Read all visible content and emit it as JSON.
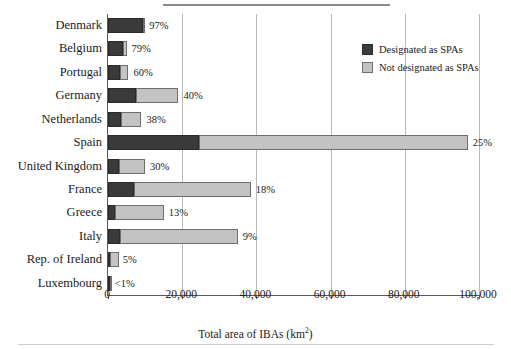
{
  "chart_data": {
    "type": "bar",
    "orientation": "horizontal",
    "stacked": true,
    "title": "",
    "xlabel": "Total area of IBAs (km²)",
    "ylabel": "",
    "xlim": [
      0,
      100000
    ],
    "xticks": [
      0,
      20000,
      40000,
      60000,
      80000,
      100000
    ],
    "xticklabels": [
      "0",
      "20,000",
      "40,000",
      "60,000",
      "80,000",
      "100,000"
    ],
    "grid": "vertical",
    "legend_position": "top-right",
    "categories": [
      "Denmark",
      "Belgium",
      "Portugal",
      "Germany",
      "Netherlands",
      "Spain",
      "United Kingdom",
      "France",
      "Greece",
      "Italy",
      "Rep. of Ireland",
      "Luxembourg"
    ],
    "series": [
      {
        "name": "Designated as SPAs",
        "color": "#3a3a3a",
        "values": [
          9500,
          3950,
          3300,
          7600,
          3400,
          24500,
          3000,
          7000,
          1950,
          3150,
          130,
          50
        ]
      },
      {
        "name": "Not designated as SPAs",
        "color": "#c3c3c3",
        "values": [
          300,
          1050,
          2200,
          11400,
          5600,
          72500,
          7000,
          31500,
          13050,
          31850,
          2470,
          450
        ]
      }
    ],
    "annotations": [
      {
        "category": "Denmark",
        "label": "97%"
      },
      {
        "category": "Belgium",
        "label": "79%"
      },
      {
        "category": "Portugal",
        "label": "60%"
      },
      {
        "category": "Germany",
        "label": "40%"
      },
      {
        "category": "Netherlands",
        "label": "38%"
      },
      {
        "category": "Spain",
        "label": "25%"
      },
      {
        "category": "United Kingdom",
        "label": "30%"
      },
      {
        "category": "France",
        "label": "18%"
      },
      {
        "category": "Greece",
        "label": "13%"
      },
      {
        "category": "Italy",
        "label": "9%"
      },
      {
        "category": "Rep. of Ireland",
        "label": "5%"
      },
      {
        "category": "Luxembourg",
        "label": "<1%"
      }
    ],
    "annotation_note": "Percentage labels indicate the share of total IBA area designated as SPAs"
  },
  "legend": {
    "items": [
      {
        "label": "Designated as SPAs",
        "color": "#3a3a3a"
      },
      {
        "label": "Not designated as SPAs",
        "color": "#c3c3c3"
      }
    ]
  }
}
